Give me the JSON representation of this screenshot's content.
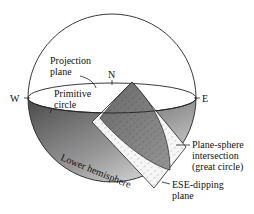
{
  "diagram": {
    "compass": {
      "north": "N",
      "west": "W",
      "east": "E"
    },
    "labels": {
      "projection_plane": [
        "Projection",
        "plane"
      ],
      "primitive_circle": [
        "Primitive",
        "circle"
      ],
      "lower_hemisphere": "Lower hemisphere",
      "plane_sphere_intersection": [
        "Plane-sphere",
        "intersection",
        "(great circle)"
      ],
      "dipping_plane": [
        "ESE-dipping",
        "plane"
      ]
    },
    "colors": {
      "outline": "#222222",
      "hemisphere_dark": "#555555",
      "hemisphere_light": "#e8e8e8",
      "plane_fill": "#f2f2f2",
      "intersection_fill": "#6a6a6a"
    }
  }
}
